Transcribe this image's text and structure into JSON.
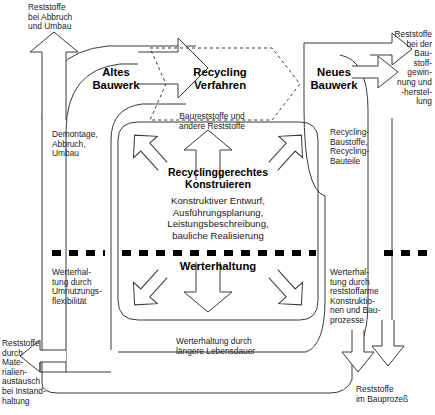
{
  "diagram": {
    "nodes": {
      "old_building": "Altes\nBauwerk",
      "recycling_process": "Recycling\nVerfahren",
      "new_building": "Neues\nBauwerk",
      "core_heading": "Recyclinggerechtes\nKonstruieren",
      "core_body": "Konstruktiver Entwurf,\nAusführungsplanung,\nLeistungsbeschreibung,\nbauliche Realisierung",
      "value_preservation": "Werterhaltung"
    },
    "labels": {
      "top_left_output": "Reststoffe\nbei Abbruch\nund Umbau",
      "left_mid": "Demontage,\nAbbruch,\nUmbau",
      "recycling_input": "Baureststoffe und\nandere Reststoffe",
      "top_right_output": "Reststoffe\nbei der\nBau-\nstoff-\ngewin-\nnung und\n-herstel-\nlung",
      "right_mid": "Recycling-\nBaustoffe,\nRecycling-\nBauteile",
      "left_lower": "Werterhal-\ntung durch\nUmnutzungs-\nflexibilität",
      "bottom_left_output": "Reststoffe\ndurch\nMate-\nrialien-\naustausch\nbei Instand-\nhaltung",
      "bottom_center": "Werterhaltung durch\nlängere Lebensdauer",
      "right_lower": "Werterhal-\ntung durch\nreststoffarme\nKonstruktio-\nnen und Bau-\nprozesse",
      "bottom_right_output": "Reststoffe\nim Bauprozeß"
    },
    "colors": {
      "stroke": "#3a3a3a",
      "text": "#1a1a1a",
      "heading": "#000000",
      "divider": "#000000",
      "background": "#ffffff"
    }
  }
}
